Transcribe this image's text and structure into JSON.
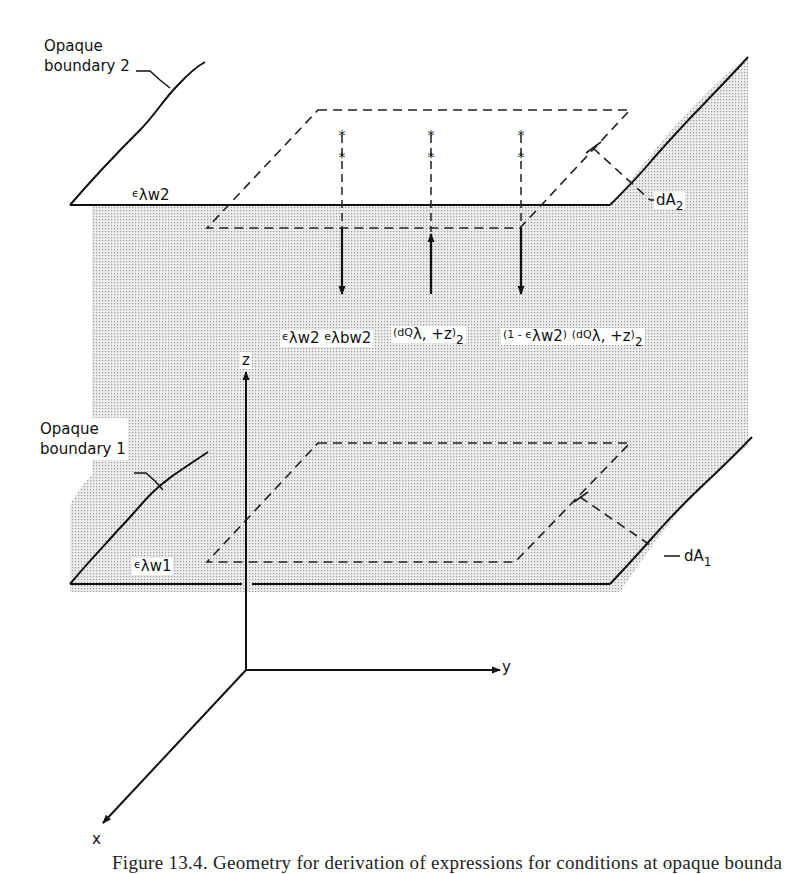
{
  "figure": {
    "labels": {
      "boundary_2": [
        "Opaque",
        "boundary 2"
      ],
      "boundary_1": [
        "Opaque",
        "boundary 1"
      ],
      "emissivity_w2": {
        "main": "ϵ",
        "sub": "λw2"
      },
      "emissivity_w1": {
        "main": "ϵ",
        "sub": "λw1"
      },
      "area_2": {
        "main": "dA",
        "sub": "2"
      },
      "area_1": {
        "main": "dA",
        "sub": "1"
      },
      "axis_z": "z",
      "axis_y": "y",
      "axis_x": "x",
      "flux_emitted": {
        "e1": "ϵ",
        "s1": "λw2",
        "e2": "e",
        "s2": "λbw2"
      },
      "flux_incident": {
        "open": "(dQ",
        "s1": "λ, +z",
        "close": ")",
        "s2": "2"
      },
      "flux_reflected": {
        "pre": "(1 - ϵ",
        "s1": "λw2",
        "mid": ")",
        "open": "(dQ",
        "s2": "λ, +z",
        "close": ")",
        "s3": "2"
      }
    },
    "colors": {
      "ink": "#111111",
      "stipple_dot": "#9a9a9a",
      "stipple_bg": "#ebebeb",
      "paper": "#ffffff"
    },
    "caption": "Figure 13.4. Geometry for derivation of expressions for conditions at opaque bounda"
  }
}
